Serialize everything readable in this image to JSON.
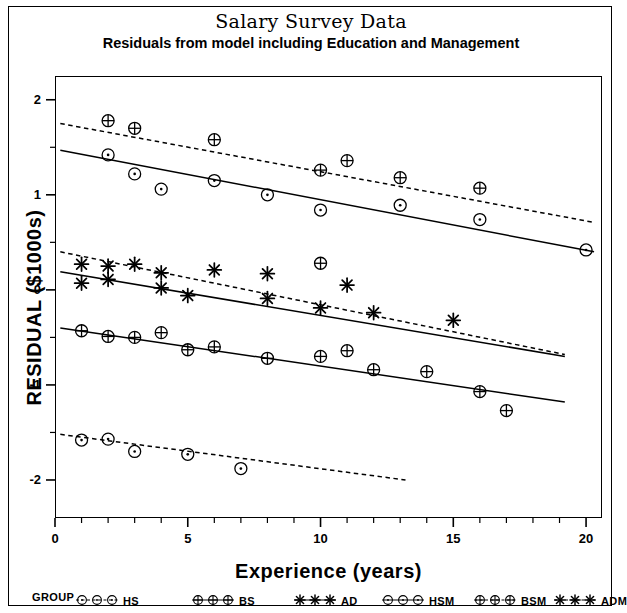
{
  "chart_data": {
    "type": "scatter",
    "title": "Salary Survey Data",
    "subtitle": "Residuals from model including Education and Management",
    "xlabel": "Experience (years)",
    "ylabel": "RESIDUAL ($1000s)",
    "xlim": [
      0,
      20.6
    ],
    "ylim": [
      -2.4,
      2.25
    ],
    "xticks": [
      0,
      5,
      10,
      15,
      20
    ],
    "xtick_labels": [
      "0",
      "5",
      "10",
      "15",
      "20"
    ],
    "xminor_step": 1,
    "yticks": [
      2,
      1,
      0,
      -1,
      -2
    ],
    "ytick_labels": [
      "2",
      "1",
      "0",
      "-1",
      "-2"
    ],
    "yminor_step": 0.5,
    "grid": false,
    "legend_position": "below-axes",
    "legend_title": "GROUP",
    "series": [
      {
        "name": "HS",
        "marker": "circle-dot",
        "line_style": "dashed",
        "points": [
          {
            "x": 1,
            "y": -1.58
          },
          {
            "x": 2,
            "y": -1.57
          },
          {
            "x": 3,
            "y": -1.7
          },
          {
            "x": 5,
            "y": -1.73
          },
          {
            "x": 7,
            "y": -1.88
          }
        ],
        "fit_line": {
          "x1": 0.2,
          "y1": -1.52,
          "x2": 13.2,
          "y2": -2.0
        }
      },
      {
        "name": "BS",
        "marker": "circle-cross",
        "line_style": "solid",
        "points": [
          {
            "x": 1,
            "y": -0.43
          },
          {
            "x": 2,
            "y": -0.49
          },
          {
            "x": 3,
            "y": -0.5
          },
          {
            "x": 4,
            "y": -0.45
          },
          {
            "x": 5,
            "y": -0.63
          },
          {
            "x": 6,
            "y": -0.6
          },
          {
            "x": 8,
            "y": -0.72
          },
          {
            "x": 10,
            "y": -0.7
          },
          {
            "x": 11,
            "y": -0.64
          },
          {
            "x": 12,
            "y": -0.84
          },
          {
            "x": 14,
            "y": -0.86
          },
          {
            "x": 16,
            "y": -1.07
          },
          {
            "x": 17,
            "y": -1.27
          }
        ],
        "fit_line": {
          "x1": 0.2,
          "y1": -0.4,
          "x2": 19.2,
          "y2": -1.18
        }
      },
      {
        "name": "AD",
        "marker": "asterisk",
        "line_style": "solid",
        "points": [
          {
            "x": 1,
            "y": 0.07
          },
          {
            "x": 2,
            "y": 0.11
          },
          {
            "x": 4,
            "y": 0.02
          },
          {
            "x": 5,
            "y": -0.06
          },
          {
            "x": 8,
            "y": -0.09
          },
          {
            "x": 10,
            "y": -0.19
          }
        ],
        "fit_line": {
          "x1": 0.2,
          "y1": 0.19,
          "x2": 19.2,
          "y2": -0.7
        }
      },
      {
        "name": "HSM",
        "marker": "circle-dot",
        "line_style": "solid",
        "points": [
          {
            "x": 2,
            "y": 1.42
          },
          {
            "x": 3,
            "y": 1.22
          },
          {
            "x": 4,
            "y": 1.06
          },
          {
            "x": 6,
            "y": 1.15
          },
          {
            "x": 8,
            "y": 1.0
          },
          {
            "x": 10,
            "y": 0.84
          },
          {
            "x": 13,
            "y": 0.89
          },
          {
            "x": 16,
            "y": 0.74
          },
          {
            "x": 20,
            "y": 0.42
          }
        ],
        "fit_line": {
          "x1": 0.2,
          "y1": 1.47,
          "x2": 20.3,
          "y2": 0.4
        }
      },
      {
        "name": "BSM",
        "marker": "circle-cross",
        "line_style": "dashed",
        "points": [
          {
            "x": 2,
            "y": 1.78
          },
          {
            "x": 3,
            "y": 1.7
          },
          {
            "x": 6,
            "y": 1.58
          },
          {
            "x": 10,
            "y": 1.26
          },
          {
            "x": 11,
            "y": 1.36
          },
          {
            "x": 13,
            "y": 1.18
          },
          {
            "x": 16,
            "y": 1.07
          },
          {
            "x": 10,
            "y": 0.28
          }
        ],
        "fit_line": {
          "x1": 0.2,
          "y1": 1.75,
          "x2": 20.3,
          "y2": 0.71
        }
      },
      {
        "name": "ADM",
        "marker": "asterisk",
        "line_style": "dashed",
        "points": [
          {
            "x": 1,
            "y": 0.27
          },
          {
            "x": 2,
            "y": 0.25
          },
          {
            "x": 3,
            "y": 0.27
          },
          {
            "x": 4,
            "y": 0.18
          },
          {
            "x": 6,
            "y": 0.21
          },
          {
            "x": 8,
            "y": 0.17
          },
          {
            "x": 11,
            "y": 0.05
          },
          {
            "x": 12,
            "y": -0.24
          },
          {
            "x": 15,
            "y": -0.32
          }
        ],
        "fit_line": {
          "x1": 0.2,
          "y1": 0.4,
          "x2": 19.2,
          "y2": -0.68
        }
      }
    ]
  },
  "legend": {
    "title": "GROUP",
    "entries": [
      {
        "label": "HS",
        "marker": "circle-dot"
      },
      {
        "label": "BS",
        "marker": "circle-cross"
      },
      {
        "label": "AD",
        "marker": "asterisk"
      },
      {
        "label": "HSM",
        "marker": "circle-dot"
      },
      {
        "label": "BSM",
        "marker": "circle-cross"
      },
      {
        "label": "ADM",
        "marker": "asterisk"
      }
    ]
  },
  "colors": {
    "ink": "#000000",
    "background": "#ffffff"
  }
}
